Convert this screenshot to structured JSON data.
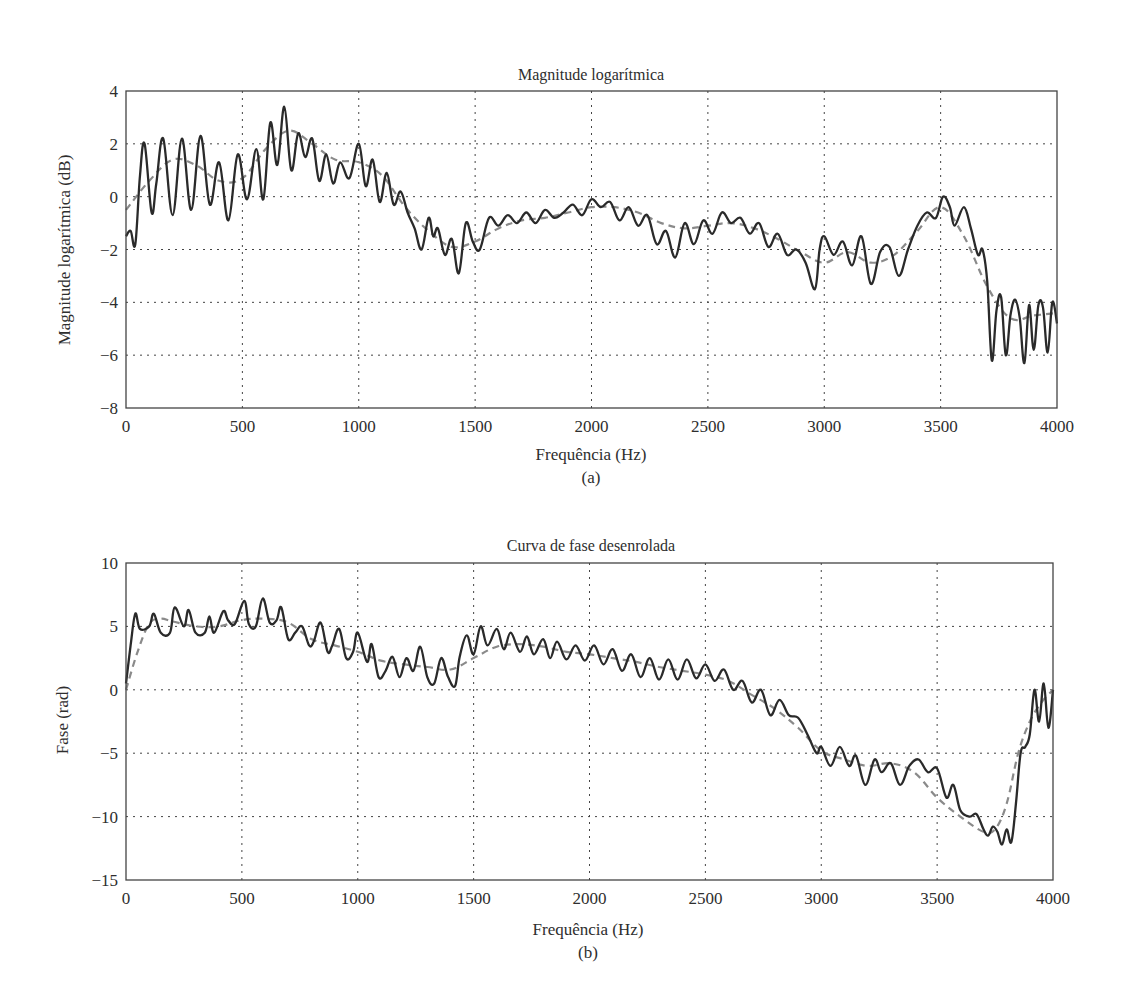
{
  "chart_data": [
    {
      "type": "line",
      "panel": "(a)",
      "title": "Magnitude logarítmica",
      "xlabel": "Frequência (Hz)",
      "ylabel": "Magnitude logarítmica (dB)",
      "caption": "(a)",
      "xlim": [
        0,
        4000
      ],
      "ylim": [
        -8,
        4
      ],
      "xticks": [
        0,
        500,
        1000,
        1500,
        2000,
        2500,
        3000,
        3500,
        4000
      ],
      "yticks": [
        -8,
        -6,
        -4,
        -2,
        0,
        2,
        4
      ],
      "ytick_labels": [
        "−8",
        "−6",
        "−4",
        "−2",
        "0",
        "2",
        "4"
      ],
      "grid": true,
      "series": [
        {
          "name": "spectrum (solid)",
          "style": "solid",
          "color": "#2a2a2a",
          "x": [
            0,
            20,
            40,
            60,
            80,
            110,
            130,
            160,
            200,
            240,
            280,
            320,
            360,
            400,
            440,
            480,
            520,
            560,
            590,
            620,
            650,
            680,
            710,
            740,
            770,
            800,
            830,
            860,
            890,
            920,
            960,
            1000,
            1030,
            1060,
            1090,
            1120,
            1150,
            1180,
            1210,
            1240,
            1270,
            1300,
            1320,
            1340,
            1370,
            1400,
            1430,
            1460,
            1490,
            1520,
            1560,
            1600,
            1640,
            1680,
            1720,
            1760,
            1800,
            1840,
            1880,
            1920,
            1960,
            2000,
            2040,
            2080,
            2120,
            2160,
            2200,
            2240,
            2280,
            2320,
            2360,
            2400,
            2440,
            2480,
            2520,
            2560,
            2600,
            2640,
            2680,
            2720,
            2760,
            2800,
            2840,
            2880,
            2920,
            2960,
            2980,
            3000,
            3040,
            3080,
            3120,
            3160,
            3200,
            3240,
            3280,
            3320,
            3360,
            3400,
            3440,
            3480,
            3510,
            3540,
            3560,
            3600,
            3630,
            3660,
            3680,
            3700,
            3720,
            3740,
            3760,
            3780,
            3800,
            3820,
            3840,
            3860,
            3880,
            3900,
            3920,
            3940,
            3960,
            3980,
            4000
          ],
          "y": [
            -1.5,
            -1.3,
            -1.8,
            0.8,
            2.0,
            -0.6,
            0.5,
            2.2,
            -0.7,
            2.2,
            -0.5,
            2.3,
            -0.3,
            1.3,
            -0.9,
            1.6,
            -0.1,
            1.8,
            -0.1,
            2.8,
            1.2,
            3.4,
            1.0,
            2.4,
            1.5,
            2.2,
            0.6,
            1.6,
            0.5,
            1.3,
            0.7,
            2.0,
            0.4,
            1.4,
            -0.2,
            0.9,
            -0.3,
            0.2,
            -0.6,
            -1.2,
            -2.0,
            -0.8,
            -1.5,
            -1.2,
            -2.2,
            -1.6,
            -2.9,
            -1.0,
            -1.7,
            -2.0,
            -0.8,
            -1.1,
            -0.7,
            -1.0,
            -0.6,
            -1.0,
            -0.5,
            -0.8,
            -0.6,
            -0.3,
            -0.7,
            -0.1,
            -0.4,
            -0.2,
            -0.9,
            -0.4,
            -1.1,
            -0.7,
            -1.8,
            -1.3,
            -2.3,
            -1.0,
            -1.8,
            -0.9,
            -1.4,
            -0.6,
            -1.0,
            -0.8,
            -1.4,
            -1.0,
            -1.9,
            -1.4,
            -2.2,
            -2.0,
            -2.5,
            -3.5,
            -2.0,
            -1.5,
            -2.2,
            -1.7,
            -2.6,
            -1.5,
            -3.3,
            -2.1,
            -1.9,
            -3.0,
            -2.0,
            -1.1,
            -0.6,
            -0.8,
            0.0,
            -0.4,
            -1.1,
            -0.4,
            -1.2,
            -2.2,
            -2.0,
            -3.2,
            -6.2,
            -4.3,
            -3.8,
            -6.0,
            -4.5,
            -3.9,
            -4.6,
            -6.3,
            -4.1,
            -5.8,
            -4.1,
            -4.2,
            -5.9,
            -4.0,
            -4.8,
            -3.9,
            -5.0
          ]
        },
        {
          "name": "smoothed (dashed)",
          "style": "dashed",
          "color": "#8a8a8a",
          "x": [
            0,
            100,
            200,
            300,
            400,
            500,
            600,
            700,
            800,
            900,
            1000,
            1100,
            1200,
            1300,
            1400,
            1500,
            1600,
            1700,
            1800,
            1900,
            2000,
            2100,
            2200,
            2300,
            2400,
            2500,
            2600,
            2700,
            2800,
            2900,
            3000,
            3100,
            3200,
            3300,
            3400,
            3500,
            3600,
            3700,
            3800,
            3900,
            4000
          ],
          "y": [
            -0.5,
            0.6,
            1.4,
            1.2,
            0.6,
            0.7,
            1.8,
            2.5,
            2.0,
            1.4,
            1.3,
            0.8,
            -0.4,
            -1.3,
            -1.9,
            -1.7,
            -1.2,
            -0.9,
            -0.8,
            -0.6,
            -0.4,
            -0.4,
            -0.6,
            -1.0,
            -1.2,
            -1.1,
            -1.0,
            -1.2,
            -1.6,
            -2.1,
            -2.5,
            -2.1,
            -2.5,
            -2.2,
            -1.3,
            -0.4,
            -1.5,
            -3.4,
            -4.6,
            -4.5,
            -4.4
          ]
        }
      ]
    },
    {
      "type": "line",
      "panel": "(b)",
      "title": "Curva de fase desenrolada",
      "xlabel": "Frequência (Hz)",
      "ylabel": "Fase (rad)",
      "caption": "(b)",
      "xlim": [
        0,
        4000
      ],
      "ylim": [
        -15,
        10
      ],
      "xticks": [
        0,
        500,
        1000,
        1500,
        2000,
        2500,
        3000,
        3500,
        4000
      ],
      "yticks": [
        -15,
        -10,
        -5,
        0,
        5,
        10
      ],
      "ytick_labels": [
        "−15",
        "−10",
        "−5",
        "0",
        "5",
        "10"
      ],
      "grid": true,
      "series": [
        {
          "name": "unwrapped phase (solid)",
          "style": "solid",
          "color": "#2a2a2a",
          "x": [
            0,
            20,
            40,
            60,
            100,
            120,
            150,
            190,
            210,
            250,
            270,
            300,
            340,
            360,
            380,
            420,
            440,
            470,
            510,
            530,
            560,
            590,
            620,
            650,
            670,
            700,
            730,
            760,
            790,
            810,
            840,
            870,
            890,
            920,
            950,
            980,
            1000,
            1040,
            1060,
            1090,
            1120,
            1150,
            1180,
            1210,
            1240,
            1270,
            1300,
            1330,
            1360,
            1390,
            1420,
            1440,
            1470,
            1500,
            1530,
            1560,
            1600,
            1630,
            1660,
            1700,
            1730,
            1760,
            1800,
            1830,
            1860,
            1900,
            1940,
            1980,
            2020,
            2060,
            2100,
            2140,
            2180,
            2220,
            2260,
            2300,
            2340,
            2380,
            2420,
            2460,
            2500,
            2540,
            2580,
            2620,
            2660,
            2700,
            2740,
            2780,
            2820,
            2860,
            2900,
            2940,
            2980,
            3000,
            3040,
            3080,
            3120,
            3150,
            3190,
            3230,
            3260,
            3300,
            3340,
            3380,
            3420,
            3460,
            3500,
            3540,
            3570,
            3600,
            3640,
            3670,
            3700,
            3720,
            3740,
            3760,
            3780,
            3800,
            3820,
            3840,
            3860,
            3880,
            3900,
            3920,
            3940,
            3960,
            3980,
            4000
          ],
          "y": [
            0.5,
            3.5,
            6.0,
            4.8,
            5.0,
            6.0,
            4.5,
            4.5,
            6.5,
            5.0,
            6.3,
            4.5,
            4.5,
            5.8,
            4.5,
            6.2,
            5.5,
            5.2,
            7.0,
            5.2,
            5.0,
            7.2,
            5.3,
            5.5,
            6.5,
            4.0,
            4.5,
            5.0,
            3.5,
            3.8,
            5.3,
            3.0,
            3.5,
            4.8,
            2.5,
            3.0,
            4.5,
            2.2,
            3.6,
            1.0,
            1.5,
            2.6,
            1.0,
            2.5,
            1.5,
            3.4,
            1.0,
            0.5,
            2.5,
            1.0,
            0.3,
            2.6,
            4.3,
            2.8,
            5.0,
            3.5,
            4.8,
            3.2,
            4.5,
            3.0,
            4.2,
            2.8,
            4.0,
            2.5,
            3.8,
            2.4,
            3.5,
            2.3,
            3.5,
            2.0,
            3.2,
            1.5,
            2.8,
            1.0,
            2.5,
            0.8,
            2.4,
            0.8,
            2.4,
            0.9,
            2.0,
            0.7,
            1.6,
            0.0,
            0.7,
            -1.0,
            0.0,
            -2.0,
            -0.8,
            -2.0,
            -2.2,
            -3.5,
            -5.0,
            -4.5,
            -6.0,
            -4.5,
            -6.0,
            -5.2,
            -7.5,
            -5.5,
            -6.5,
            -5.8,
            -7.5,
            -6.0,
            -5.5,
            -6.5,
            -6.2,
            -8.5,
            -7.5,
            -9.5,
            -10.0,
            -9.8,
            -11.0,
            -11.5,
            -10.8,
            -11.2,
            -12.2,
            -11.0,
            -12.0,
            -9.0,
            -5.0,
            -4.5,
            -3.5,
            0.0,
            -2.5,
            0.5,
            -3.0,
            0.0,
            2.5,
            0.0
          ]
        },
        {
          "name": "smoothed phase (dashed)",
          "style": "dashed",
          "color": "#8a8a8a",
          "x": [
            0,
            50,
            100,
            150,
            200,
            300,
            400,
            500,
            600,
            700,
            800,
            900,
            1000,
            1100,
            1200,
            1300,
            1400,
            1500,
            1600,
            1700,
            1800,
            1900,
            2000,
            2100,
            2200,
            2300,
            2400,
            2500,
            2600,
            2700,
            2800,
            2900,
            3000,
            3100,
            3200,
            3300,
            3400,
            3500,
            3600,
            3700,
            3750,
            3800,
            3850,
            3900,
            3950,
            4000
          ],
          "y": [
            0.0,
            3.0,
            5.2,
            5.6,
            5.4,
            5.0,
            5.0,
            5.5,
            5.6,
            5.3,
            4.0,
            3.5,
            3.0,
            2.3,
            2.0,
            1.8,
            1.6,
            2.5,
            3.4,
            3.6,
            3.4,
            3.0,
            2.8,
            2.5,
            2.2,
            1.8,
            1.5,
            1.2,
            0.7,
            -0.4,
            -1.5,
            -3.0,
            -4.8,
            -5.5,
            -6.0,
            -5.8,
            -6.5,
            -8.5,
            -10.0,
            -11.2,
            -11.0,
            -9.0,
            -5.0,
            -2.5,
            -1.0,
            0.0
          ]
        }
      ]
    }
  ]
}
